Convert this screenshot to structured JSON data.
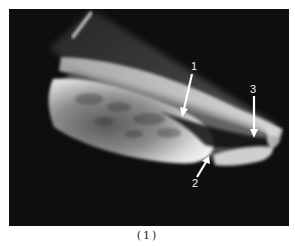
{
  "figure": {
    "caption": "(1)",
    "annotations": [
      {
        "id": "1",
        "label": "1"
      },
      {
        "id": "2",
        "label": "2"
      },
      {
        "id": "3",
        "label": "3"
      }
    ],
    "colors": {
      "background": "#0e0e0e",
      "highlight": "#e8e8e8",
      "arrow": "#ffffff"
    }
  }
}
